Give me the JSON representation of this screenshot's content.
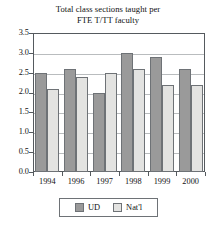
{
  "chart_data": {
    "type": "bar",
    "title": "Total class sections taught per FTE T/TT faculty",
    "title_lines": [
      "Total class sections taught per",
      "FTE T/TT faculty"
    ],
    "xlabel": "",
    "ylabel": "",
    "categories": [
      "1994",
      "1996",
      "1997",
      "1998",
      "1999",
      "2000"
    ],
    "series": [
      {
        "name": "UD",
        "color": "#9a9a9a",
        "values": [
          2.5,
          2.6,
          2.0,
          3.0,
          2.9,
          2.6
        ]
      },
      {
        "name": "Nat'l",
        "color": "#e3e3e1",
        "values": [
          2.1,
          2.4,
          2.5,
          2.6,
          2.2,
          2.2
        ]
      }
    ],
    "ylim": [
      0.0,
      3.5
    ],
    "ytick_labels": [
      "0.0",
      "0.5",
      "1.0",
      "1.5",
      "2.0",
      "2.5",
      "3.0",
      "3.5"
    ],
    "ytick_values": [
      0.0,
      0.5,
      1.0,
      1.5,
      2.0,
      2.5,
      3.0,
      3.5
    ],
    "grid": true,
    "grid_axis": "y",
    "legend_position": "bottom-center",
    "legend_entries": [
      "UD",
      "Nat'l"
    ]
  },
  "colors": {
    "ud": "#9a9a9a",
    "natl": "#e3e3e1",
    "axis": "#555a5e",
    "grid": "#b9bcbe",
    "bar_border": "#6e7276",
    "background": "#ffffff",
    "text": "#111111"
  }
}
